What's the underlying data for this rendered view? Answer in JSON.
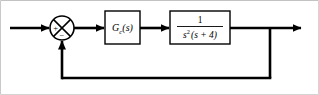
{
  "diagram": {
    "type": "control-system-block-diagram",
    "width": 319,
    "height": 95,
    "line_color": "#000000",
    "background_color": "#ffffff",
    "frame_color": "#b8b8b8"
  },
  "summing_junction": {
    "name": "summing-junction",
    "shape": "circle-with-cross",
    "center_x": 62,
    "center_y": 28,
    "radius": 12,
    "plus_sign": "+",
    "minus_sign": "−"
  },
  "blocks": [
    {
      "id": "controller",
      "name": "controller-block",
      "label": "G",
      "subscript": "c",
      "label_suffix": "(s)",
      "x": 105,
      "y": 11,
      "width": 35,
      "height": 33
    },
    {
      "id": "plant",
      "name": "plant-block",
      "numerator": "1",
      "denominator_base": "s",
      "denominator_exponent": "2",
      "denominator_rest": "(s + 4)",
      "x": 170,
      "y": 11,
      "width": 60,
      "height": 33
    }
  ],
  "signals": {
    "input_arrow": "input-signal",
    "output_arrow": "output-signal",
    "feedback_path": "unity-feedback-path",
    "takeoff_x": 270,
    "feedback_bottom_y": 78,
    "output_end_x": 311
  }
}
